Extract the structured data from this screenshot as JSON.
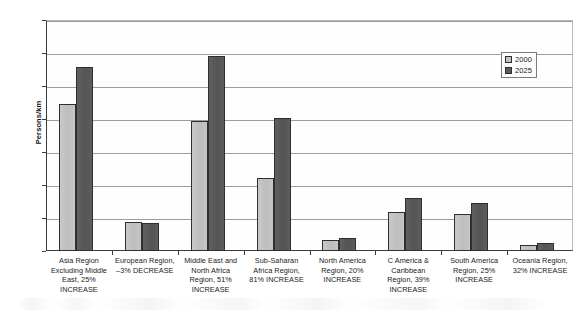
{
  "chart_data": {
    "type": "bar",
    "title": "",
    "xlabel": "",
    "ylabel": "Persons/km",
    "ylim": [
      0,
      7000
    ],
    "yticks": [
      0,
      1000,
      2000,
      3000,
      4000,
      5000,
      6000,
      7000
    ],
    "ytick_labels": [
      "0",
      "1000",
      "2000",
      "3000",
      "4000",
      "5000",
      "6000",
      "7000"
    ],
    "grid": true,
    "legend_position": "top-right",
    "categories": [
      "Asia Region Excluding Middle East, 25% INCREASE",
      "European Region, –3% DECREASE",
      "Middle East and North Africa Region, 51% INCREASE",
      "Sub-Saharan Africa Region, 81% INCREASE",
      "North America Region, 20% INCREASE",
      "C America & Caribbean Region, 39% INCREASE",
      "South America Region, 25% INCREASE",
      "Oceania Region, 32% INCREASE"
    ],
    "category_lines": [
      [
        "Asia Region",
        "Excluding Middle",
        "East, 25%",
        "INCREASE"
      ],
      [
        "European Region,",
        "–3% DECREASE"
      ],
      [
        "Middle East and",
        "North Africa",
        "Region, 51%",
        "INCREASE"
      ],
      [
        "Sub-Saharan",
        "Africa Region,",
        "81% INCREASE"
      ],
      [
        "North America",
        "Region, 20%",
        "INCREASE"
      ],
      [
        "C America &",
        "Caribbean",
        "Region, 39%",
        "INCREASE"
      ],
      [
        "South America",
        "Region, 25%",
        "INCREASE"
      ],
      [
        "Oceania Region,",
        "32% INCREASE"
      ]
    ],
    "series": [
      {
        "name": "2000",
        "color": "#c2c2c2",
        "values": [
          4450,
          880,
          3950,
          2220,
          320,
          1170,
          1130,
          170
        ]
      },
      {
        "name": "2025",
        "color": "#5b5b5b",
        "values": [
          5580,
          850,
          5920,
          4020,
          390,
          1620,
          1450,
          230
        ]
      }
    ]
  },
  "legend": {
    "items": [
      {
        "label": "2000"
      },
      {
        "label": "2025"
      }
    ]
  },
  "axis": {
    "y_title": "Persons/km"
  }
}
